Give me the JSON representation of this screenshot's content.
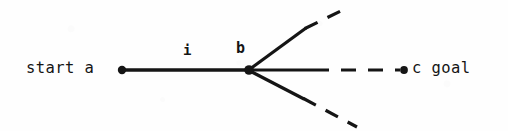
{
  "figure": {
    "kind": "search-tree-diagram",
    "background_color": "#fefefe",
    "ink_color": "#151515"
  },
  "labels": {
    "start_text": "start a",
    "goal_text": "c goal",
    "edge_label_i": "i",
    "node_label_b": "b"
  },
  "nodes": [
    {
      "id": "a",
      "label": "a",
      "role": "start",
      "x": 122,
      "y": 70,
      "radius": 4.2
    },
    {
      "id": "b",
      "label": "b",
      "role": "intermediate",
      "x": 249,
      "y": 70,
      "radius": 4.6
    },
    {
      "id": "c",
      "label": "c",
      "role": "goal",
      "x": 404,
      "y": 70,
      "radius": 3.8
    }
  ],
  "edges": [
    {
      "id": "a-b",
      "from": "a",
      "to": "b",
      "style": "solid",
      "label": "i",
      "x1": 122,
      "y1": 70,
      "x2": 249,
      "y2": 70
    },
    {
      "id": "b-c-solid",
      "from": "b",
      "style": "solid",
      "direction": "horizontal",
      "x1": 249,
      "y1": 70,
      "x2": 314,
      "y2": 70
    },
    {
      "id": "b-c-dashed",
      "to": "c",
      "style": "dashed",
      "direction": "horizontal",
      "x1": 314,
      "y1": 70,
      "x2": 400,
      "y2": 70
    },
    {
      "id": "b-up-solid",
      "from": "b",
      "style": "solid",
      "direction": "up-right",
      "x1": 250,
      "y1": 69,
      "x2": 306,
      "y2": 28
    },
    {
      "id": "b-up-dashed",
      "style": "dashed",
      "direction": "up-right",
      "x1": 306,
      "y1": 28,
      "x2": 348,
      "y2": 8
    },
    {
      "id": "b-down-solid",
      "from": "b",
      "style": "solid",
      "direction": "down-right",
      "x1": 250,
      "y1": 71,
      "x2": 304,
      "y2": 99
    },
    {
      "id": "b-down-dashed",
      "style": "dashed",
      "direction": "down-right",
      "x1": 304,
      "y1": 99,
      "x2": 356,
      "y2": 126
    }
  ]
}
